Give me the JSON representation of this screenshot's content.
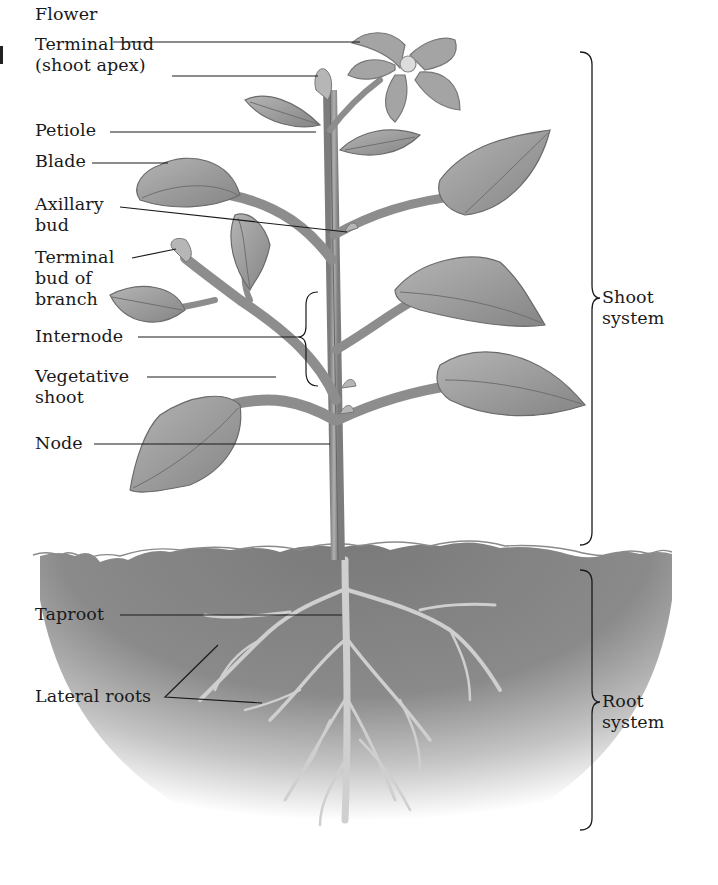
{
  "diagram": {
    "colors": {
      "background": "#ffffff",
      "plant_fill": "#9a9a9a",
      "plant_dark": "#6e6e6e",
      "soil": "#7d7d7d",
      "label_text": "#1a1a1a",
      "leader_line": "#1a1a1a"
    },
    "labels": {
      "flower": "Flower",
      "terminal_bud": "Terminal bud\n(shoot apex)",
      "petiole": "Petiole",
      "blade": "Blade",
      "axillary_bud": "Axillary\nbud",
      "terminal_bud_branch": "Terminal\nbud of\nbranch",
      "internode": "Internode",
      "vegetative_shoot": "Vegetative\nshoot",
      "node": "Node",
      "taproot": "Taproot",
      "lateral_roots": "Lateral roots",
      "shoot_system": "Shoot\nsystem",
      "root_system": "Root\nsystem"
    },
    "groups": [
      {
        "name": "Shoot system",
        "bracket_top": 52,
        "bracket_bottom": 545
      },
      {
        "name": "Root system",
        "bracket_top": 570,
        "bracket_bottom": 830
      }
    ]
  }
}
